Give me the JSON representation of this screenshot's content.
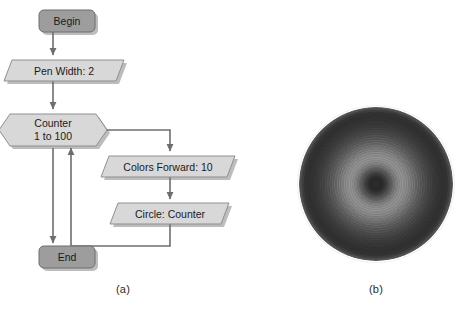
{
  "figure": {
    "panels": [
      {
        "id": "a",
        "caption": "(a)",
        "kind": "flowchart"
      },
      {
        "id": "b",
        "caption": "(b)",
        "kind": "raster-artwork"
      }
    ]
  },
  "flowchart": {
    "nodes": [
      {
        "id": "begin",
        "label": "Begin",
        "shape": "terminator",
        "fill": "#9d9d9d",
        "stroke": "#6d6d6d"
      },
      {
        "id": "pen-width",
        "label": "Pen Width: 2",
        "shape": "parallelogram",
        "fill": "#d8d8d8",
        "stroke": "#8f8f8f"
      },
      {
        "id": "counter",
        "label_line1": "Counter",
        "label_line2": "1 to 100",
        "shape": "hexagon",
        "fill": "#d8d8d8",
        "stroke": "#8f8f8f"
      },
      {
        "id": "colors-forward",
        "label": "Colors Forward: 10",
        "shape": "parallelogram",
        "fill": "#d8d8d8",
        "stroke": "#8f8f8f"
      },
      {
        "id": "circle-counter",
        "label": "Circle: Counter",
        "shape": "parallelogram",
        "fill": "#d8d8d8",
        "stroke": "#8f8f8f"
      },
      {
        "id": "end",
        "label": "End",
        "shape": "terminator",
        "fill": "#9d9d9d",
        "stroke": "#6d6d6d"
      }
    ],
    "edges": [
      {
        "id": "begin-to-pen-width",
        "from": "begin",
        "to": "pen-width",
        "arrow": true
      },
      {
        "id": "pen-width-to-counter",
        "from": "pen-width",
        "to": "counter",
        "arrow": true
      },
      {
        "id": "counter-to-colors-forward",
        "from": "counter",
        "to": "colors-forward",
        "arrow": true
      },
      {
        "id": "colors-forward-to-circle",
        "from": "colors-forward",
        "to": "circle-counter",
        "arrow": true
      },
      {
        "id": "circle-loop-back-counter",
        "from": "circle-counter",
        "to": "counter",
        "arrow": true
      },
      {
        "id": "counter-to-end",
        "from": "counter",
        "to": "end",
        "arrow": true
      }
    ],
    "colors": {
      "line": "#6e6e6e",
      "terminator_fill": "#9d9d9d",
      "process_fill": "#d8d8d8",
      "shadow": "#b8b8b8",
      "text": "#1a1a1a"
    }
  },
  "artwork_b": {
    "description": "concentric-circles",
    "center_x": 376,
    "center_y": 184,
    "radius": 77,
    "core_color": "#2e2e2e",
    "ring_light_color": "#8f8f8f",
    "outer_color": "#2f2f2f"
  }
}
